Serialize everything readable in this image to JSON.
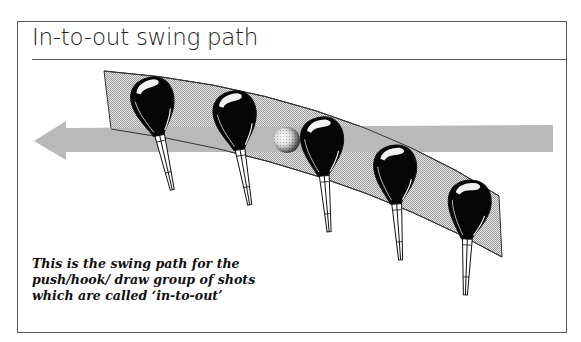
{
  "title": "In-to-out swing path",
  "caption": "This is the swing path for the push/hook/ draw group of shots which are called ‘in-to-out’",
  "illustration": {
    "arrow": {
      "direction": "left",
      "color": "#b9b9b9"
    },
    "swing_band": {
      "fill": "#cfcfcf",
      "stroke": "#333333"
    },
    "clubs_count": 5,
    "ball": "golf-ball"
  }
}
